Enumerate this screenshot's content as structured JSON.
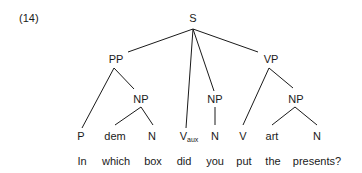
{
  "example_number": "(14)",
  "tree": {
    "root": "S",
    "nodes": {
      "S": "S",
      "PP": "PP",
      "NP_pp": "NP",
      "NP_subj": "NP",
      "VP": "VP",
      "NP_obj": "NP"
    },
    "preterminals": [
      {
        "label": "P",
        "sub": ""
      },
      {
        "label": "dem",
        "sub": ""
      },
      {
        "label": "N",
        "sub": ""
      },
      {
        "label": "V",
        "sub": "aux"
      },
      {
        "label": "N",
        "sub": ""
      },
      {
        "label": "V",
        "sub": ""
      },
      {
        "label": "art",
        "sub": ""
      },
      {
        "label": "N",
        "sub": ""
      }
    ],
    "words": [
      "In",
      "which",
      "box",
      "did",
      "you",
      "put",
      "the",
      "presents?"
    ]
  }
}
